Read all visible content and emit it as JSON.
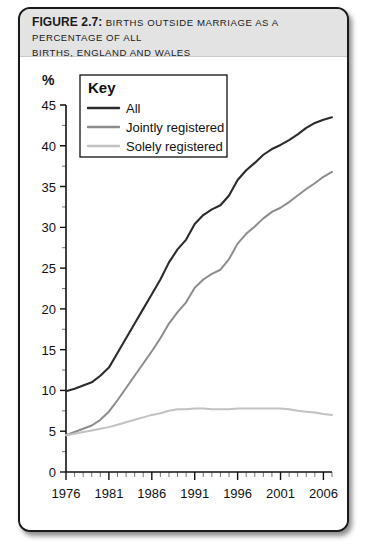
{
  "figure": {
    "number_label": "FIGURE 2.7:",
    "title_rest": "BIRTHS OUTSIDE MARRIAGE AS A PERCENTAGE OF ALL",
    "title_line2": "BIRTHS, ENGLAND AND WALES"
  },
  "legend": {
    "heading": "Key",
    "items": [
      {
        "label": "All",
        "color": "#2b2b2b"
      },
      {
        "label": "Jointly registered",
        "color": "#8c8c8c"
      },
      {
        "label": "Solely registered",
        "color": "#c2c2c2"
      }
    ]
  },
  "axis": {
    "y_unit": "%",
    "y_ticks": [
      "0",
      "5",
      "10",
      "15",
      "20",
      "25",
      "30",
      "35",
      "40",
      "45"
    ],
    "x_ticks": [
      "1976",
      "1981",
      "1986",
      "1991",
      "1996",
      "2001",
      "2006"
    ]
  },
  "chart_data": {
    "type": "line",
    "title": "Births outside marriage as a percentage of all births, England and Wales",
    "xlabel": "",
    "ylabel": "%",
    "xlim": [
      1976,
      2007
    ],
    "ylim": [
      0,
      45
    ],
    "grid": false,
    "legend_position": "top-left inset box",
    "x": [
      1976,
      1977,
      1978,
      1979,
      1980,
      1981,
      1982,
      1983,
      1984,
      1985,
      1986,
      1987,
      1988,
      1989,
      1990,
      1991,
      1992,
      1993,
      1994,
      1995,
      1996,
      1997,
      1998,
      1999,
      2000,
      2001,
      2002,
      2003,
      2004,
      2005,
      2006,
      2007
    ],
    "series": [
      {
        "name": "All",
        "color": "#2b2b2b",
        "values": [
          9.9,
          10.2,
          10.6,
          11.0,
          11.8,
          12.8,
          14.6,
          16.4,
          18.2,
          20.0,
          21.8,
          23.6,
          25.7,
          27.3,
          28.5,
          30.4,
          31.5,
          32.2,
          32.7,
          33.9,
          35.8,
          37.0,
          37.9,
          38.9,
          39.6,
          40.1,
          40.7,
          41.4,
          42.2,
          42.8,
          43.2,
          43.5
        ]
      },
      {
        "name": "Jointly registered",
        "color": "#8c8c8c",
        "values": [
          4.5,
          4.9,
          5.3,
          5.7,
          6.4,
          7.4,
          8.8,
          10.3,
          11.8,
          13.3,
          14.8,
          16.4,
          18.2,
          19.6,
          20.8,
          22.6,
          23.6,
          24.3,
          24.8,
          26.1,
          28.0,
          29.2,
          30.1,
          31.1,
          31.9,
          32.4,
          33.1,
          33.9,
          34.7,
          35.4,
          36.2,
          36.8
        ]
      },
      {
        "name": "Solely registered",
        "color": "#c2c2c2",
        "values": [
          4.5,
          4.7,
          4.9,
          5.1,
          5.3,
          5.5,
          5.8,
          6.1,
          6.4,
          6.7,
          7.0,
          7.2,
          7.5,
          7.7,
          7.7,
          7.8,
          7.8,
          7.7,
          7.7,
          7.7,
          7.8,
          7.8,
          7.8,
          7.8,
          7.8,
          7.8,
          7.7,
          7.5,
          7.4,
          7.3,
          7.1,
          7.0
        ]
      }
    ]
  }
}
